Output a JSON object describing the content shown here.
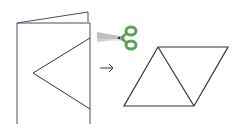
{
  "diagram": {
    "colors": {
      "line": "#333333",
      "paper_edge": "#4a4a6a",
      "scissors_handle": "#5aa05a",
      "scissors_blade": "#b8b8b8"
    },
    "elements": {
      "folded_paper": "folded-paper",
      "scissors": "scissors",
      "arrow": "→",
      "result": "rhombus-two-triangles"
    }
  }
}
